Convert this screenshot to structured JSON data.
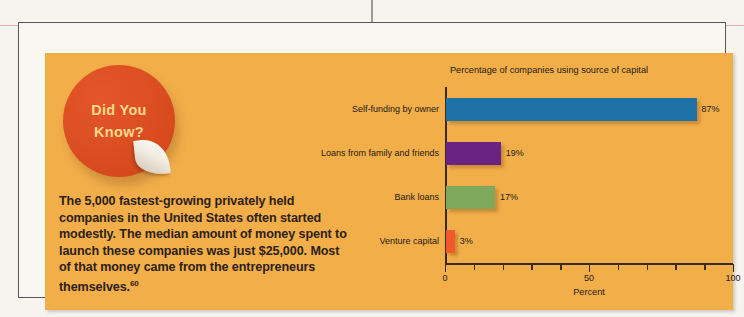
{
  "colors": {
    "panel_background": "#f2ae49",
    "page_background": "#f7f4ef",
    "frame_border": "#59565a",
    "badge_red": "#dc4f22",
    "badge_text": "#ffd88f",
    "text_dark": "#2c2118"
  },
  "callout": {
    "badge_line1": "Did You",
    "badge_line2": "Know?",
    "body_text": "The 5,000 fastest-growing privately held companies in the United States often started modestly. The median amount of money spent to launch these companies was just $25,000. Most of that money came from the entrepreneurs themselves.",
    "footnote_marker": "60"
  },
  "chart_data": {
    "type": "bar",
    "orientation": "horizontal",
    "title": "Percentage of companies using source of capital",
    "xlabel": "Percent",
    "ylabel": "",
    "categories": [
      "Self-funding by owner",
      "Loans from family and friends",
      "Bank loans",
      "Venture capital"
    ],
    "values": [
      87,
      19,
      17,
      3
    ],
    "value_labels": [
      "87%",
      "19%",
      "17%",
      "3%"
    ],
    "bar_colors": [
      "#1f72a8",
      "#6b2383",
      "#7fa85c",
      "#f05a28"
    ],
    "xlim": [
      0,
      100
    ],
    "xticks": [
      0,
      10,
      20,
      30,
      40,
      50,
      60,
      70,
      80,
      90,
      100
    ],
    "xticklabels": [
      "0",
      "",
      "",
      "",
      "",
      "50",
      "",
      "",
      "",
      "",
      "100"
    ],
    "major_ticks": [
      0,
      50,
      100
    ],
    "grid": false,
    "legend": false
  }
}
